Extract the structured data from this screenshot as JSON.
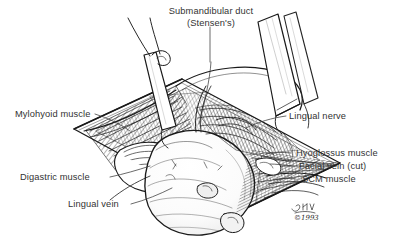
{
  "figure": {
    "kind": "surgical-anatomy-illustration",
    "style": "pen-and-ink line drawing",
    "background_color": "#ffffff",
    "ink_color": "#1a1a1a",
    "label_color": "#333333"
  },
  "labels": {
    "submandibular_duct": {
      "line1": "Submandibular duct",
      "line2": "(Stensen's)"
    },
    "mylohyoid": "Mylohyoid muscle",
    "digastric": "Digastric muscle",
    "lingual_vein": "Lingual vein",
    "lingual_nerve": "Lingual nerve",
    "hyoglossus": "Hyoglossus  muscle",
    "facial_vein": "Facial vein (cut)",
    "scm": "SCM muscle"
  },
  "signature": {
    "artist_initials": "BFW",
    "copyright": "©1993"
  }
}
